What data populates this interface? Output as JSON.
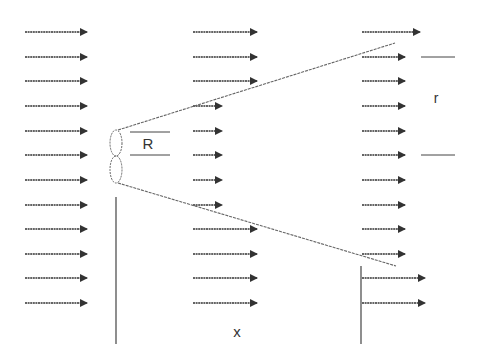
{
  "diagram": {
    "type": "wind-turbine-wake-expansion",
    "labels": {
      "rotor_radius": "R",
      "wake_radius": "r",
      "downstream_distance": "x"
    },
    "colors": {
      "arrow": "#333333",
      "wake_boundary": "#666666",
      "line": "#444444",
      "background": "#ffffff"
    },
    "rows_y": [
      32,
      57,
      81,
      106,
      131,
      155,
      180,
      205,
      229,
      254,
      278,
      303
    ],
    "columns": [
      {
        "name": "upstream",
        "x_start": 25,
        "x_end": [
          87,
          87,
          87,
          87,
          87,
          87,
          87,
          87,
          87,
          87,
          87,
          87
        ]
      },
      {
        "name": "rotor-plane",
        "x_start": 193,
        "x_end": [
          257,
          257,
          257,
          222,
          222,
          222,
          222,
          222,
          257,
          257,
          257,
          257
        ]
      },
      {
        "name": "downstream",
        "x_start": 362,
        "x_end": [
          420,
          405,
          405,
          405,
          405,
          405,
          405,
          405,
          405,
          405,
          425,
          425
        ]
      }
    ],
    "rotor": {
      "cx": 116,
      "top": 130,
      "mid": 156,
      "bottom": 183,
      "rx": 6
    },
    "wake_boundary": {
      "upper": {
        "x1": 118,
        "y1": 130,
        "x2": 395,
        "y2": 43
      },
      "lower": {
        "x1": 118,
        "y1": 183,
        "x2": 396,
        "y2": 266
      }
    },
    "vertical_lines": [
      {
        "x": 116,
        "y1": 197,
        "y2": 344
      },
      {
        "x": 361,
        "y1": 266,
        "y2": 344
      }
    ],
    "R_marker": {
      "x1": 130,
      "x2": 170,
      "y_top": 132,
      "y_bottom": 155,
      "label_x": 148,
      "label_y": 149
    },
    "r_marker": {
      "x1": 421,
      "x2": 455,
      "y_top": 57,
      "y_bottom": 155,
      "label_x": 436,
      "label_y": 103
    },
    "x_label_pos": {
      "x": 237,
      "y": 337
    }
  }
}
